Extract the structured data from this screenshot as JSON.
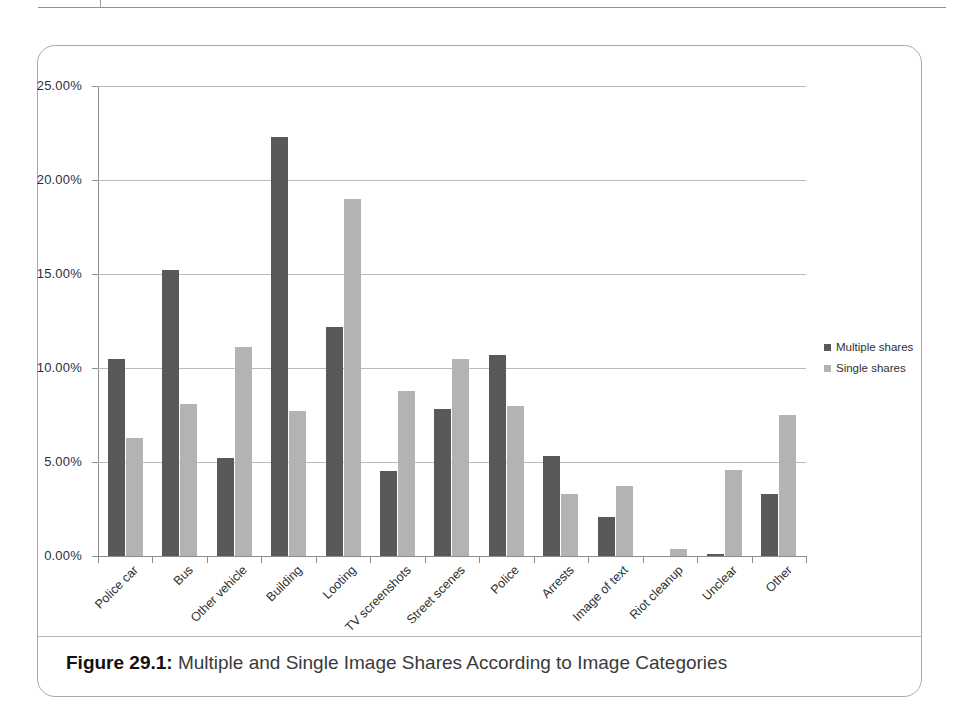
{
  "figure": {
    "caption_label": "Figure 29.1:",
    "caption_text": " Multiple and Single Image Shares According to Image Categories"
  },
  "colors": {
    "multiple_shares": "#58595b",
    "single_shares": "#b2b3b5",
    "gridline": "#b9bbbd",
    "axis": "#8a8c8e",
    "frame": "#a7a9ac"
  },
  "chart_data": {
    "type": "bar",
    "title": "",
    "subtitle": "",
    "xlabel": "",
    "ylabel": "",
    "ylim": [
      0,
      25
    ],
    "y_ticks": [
      0,
      5,
      10,
      15,
      20,
      25
    ],
    "y_tick_labels": [
      "0.00%",
      "5.00%",
      "10.00%",
      "15.00%",
      "20.00%",
      "25.00%"
    ],
    "grid": true,
    "legend_position": "right",
    "value_suffix": "%",
    "categories": [
      "Police car",
      "Bus",
      "Other vehicle",
      "Building",
      "Looting",
      "TV screenshots",
      "Street scenes",
      "Police",
      "Arrests",
      "Image of text",
      "Riot cleanup",
      "Unclear",
      "Other"
    ],
    "series": [
      {
        "name": "Multiple shares",
        "color": "#58595b",
        "values": [
          10.5,
          15.2,
          5.2,
          22.3,
          12.2,
          4.5,
          7.8,
          10.7,
          5.3,
          2.1,
          0.0,
          0.1,
          3.3
        ]
      },
      {
        "name": "Single shares",
        "color": "#b2b3b5",
        "values": [
          6.3,
          8.1,
          11.1,
          7.7,
          19.0,
          8.8,
          10.5,
          8.0,
          3.3,
          3.7,
          0.35,
          4.6,
          7.5
        ]
      }
    ]
  }
}
